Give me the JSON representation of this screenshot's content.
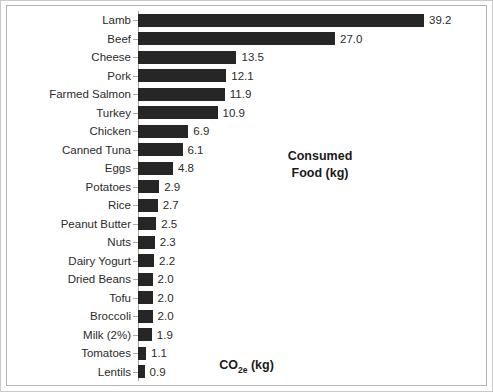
{
  "chart_data": {
    "type": "bar",
    "orientation": "horizontal",
    "title": "",
    "xlabel": "CO2e (kg)",
    "ylabel": "",
    "categories": [
      "Lamb",
      "Beef",
      "Cheese",
      "Pork",
      "Farmed Salmon",
      "Turkey",
      "Chicken",
      "Canned Tuna",
      "Eggs",
      "Potatoes",
      "Rice",
      "Peanut Butter",
      "Nuts",
      "Dairy Yogurt",
      "Dried Beans",
      "Tofu",
      "Broccoli",
      "Milk (2%)",
      "Tomatoes",
      "Lentils"
    ],
    "values": [
      39.2,
      27.0,
      13.5,
      12.1,
      11.9,
      10.9,
      6.9,
      6.1,
      4.8,
      2.9,
      2.7,
      2.5,
      2.3,
      2.2,
      2.0,
      2.0,
      2.0,
      1.9,
      1.1,
      0.9
    ],
    "value_labels": [
      "39.2",
      "27.0",
      "13.5",
      "12.1",
      "11.9",
      "10.9",
      "6.9",
      "6.1",
      "4.8",
      "2.9",
      "2.7",
      "2.5",
      "2.3",
      "2.2",
      "2.0",
      "2.0",
      "2.0",
      "1.9",
      "1.1",
      "0.9"
    ],
    "xlim": [
      0,
      39.2
    ],
    "grid": false,
    "legend": false,
    "bar_color": "#262626",
    "annotations": [
      {
        "name": "consumed-food-note",
        "line1": "Consumed",
        "line2": "Food (kg)"
      }
    ]
  },
  "axis": {
    "x_title_main": "CO",
    "x_title_sub": "2e",
    "x_title_tail": " (kg)"
  }
}
